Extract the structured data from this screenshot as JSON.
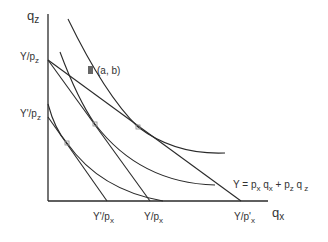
{
  "diagram": {
    "axes": {
      "y_label": {
        "base": "q",
        "sub": "z"
      },
      "x_label": {
        "base": "q",
        "sub": "x"
      }
    },
    "y_ticks": [
      {
        "base": "Y/p",
        "sub": "z"
      },
      {
        "base": "Y'/p",
        "sub": "z"
      }
    ],
    "x_ticks": [
      {
        "base": "Y'/p",
        "sub": "x"
      },
      {
        "base": "Y/p",
        "sub": "x"
      },
      {
        "base": "Y/p'",
        "sub": "x"
      }
    ],
    "point_label": "(a, b)",
    "equation": {
      "parts": [
        "Y = p",
        "x",
        " q",
        "x",
        " +  p",
        "z",
        " q",
        " z"
      ]
    },
    "colors": {
      "line": "#2a2a2a",
      "point": "#666666",
      "text": "#333333"
    }
  }
}
